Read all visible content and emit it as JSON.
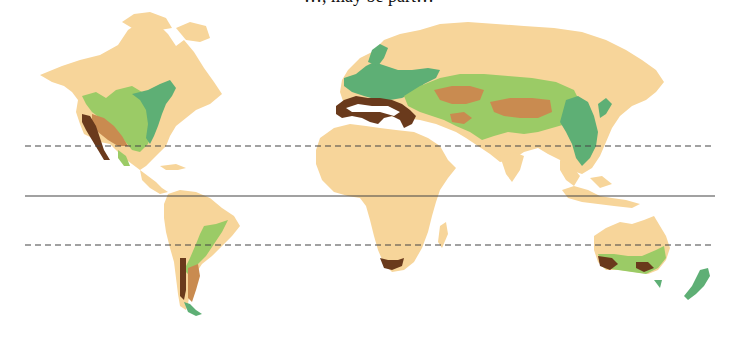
{
  "caption": {
    "text": "…, may be part…",
    "clipped": true
  },
  "map": {
    "type": "world-biome-map",
    "lines": [
      {
        "name": "tropic-of-cancer",
        "style": "dashed",
        "y": 146
      },
      {
        "name": "equator",
        "style": "solid",
        "y": 196
      },
      {
        "name": "tropic-of-capricorn",
        "style": "dashed",
        "y": 245
      }
    ],
    "colors": {
      "land": "#F7D59A",
      "light_green": "#9BCB66",
      "mid_green": "#5EAF75",
      "tan": "#C98B50",
      "dark_brown": "#6A3A1C",
      "line": "#444444"
    },
    "regions": [
      {
        "name": "north-america",
        "zones": [
          "mid_green",
          "light_green",
          "tan",
          "dark_brown"
        ]
      },
      {
        "name": "south-america",
        "zones": [
          "light_green",
          "tan",
          "dark_brown",
          "mid_green"
        ]
      },
      {
        "name": "europe-asia",
        "zones": [
          "mid_green",
          "light_green",
          "tan",
          "dark_brown"
        ]
      },
      {
        "name": "africa",
        "zones": [
          "dark_brown"
        ]
      },
      {
        "name": "australia",
        "zones": [
          "light_green",
          "dark_brown",
          "mid_green"
        ]
      },
      {
        "name": "new-zealand",
        "zones": [
          "mid_green"
        ]
      }
    ]
  }
}
